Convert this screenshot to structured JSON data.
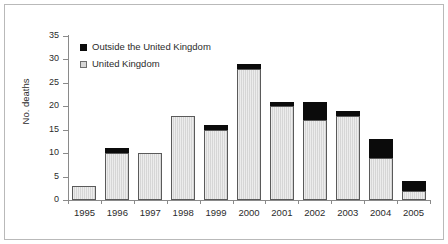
{
  "chart_data": {
    "type": "bar",
    "title": "",
    "xlabel": "",
    "ylabel": "No. deaths",
    "ylim": [
      0,
      35
    ],
    "yticks": [
      0,
      5,
      10,
      15,
      20,
      25,
      30,
      35
    ],
    "grid": false,
    "stacked": true,
    "legend_position": "inside-top-left",
    "categories": [
      "1995",
      "1996",
      "1997",
      "1998",
      "1999",
      "2000",
      "2001",
      "2002",
      "2003",
      "2004",
      "2005"
    ],
    "series": [
      {
        "name": "United Kingdom",
        "color": "#d6d6d6",
        "values": [
          3,
          10,
          10,
          18,
          15,
          28,
          20,
          17,
          18,
          9,
          2
        ]
      },
      {
        "name": "Outside the United Kingdom",
        "color": "#0b0b0b",
        "values": [
          0,
          1,
          0,
          0,
          1,
          1,
          1,
          4,
          1,
          4,
          2
        ]
      }
    ],
    "totals": [
      3,
      11,
      10,
      18,
      16,
      29,
      21,
      21,
      19,
      13,
      4
    ]
  },
  "legend": {
    "entries": [
      {
        "label": "Outside the United Kingdom",
        "swatch": "black-square-icon"
      },
      {
        "label": "United Kingdom",
        "swatch": "gray-square-icon"
      }
    ]
  }
}
